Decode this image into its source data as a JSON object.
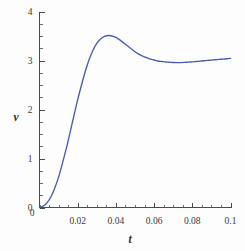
{
  "chart_data": {
    "type": "line",
    "title": "",
    "subtitle": "",
    "xlabel": "t",
    "ylabel": "v",
    "xlim": [
      0,
      0.1
    ],
    "ylim": [
      0,
      4
    ],
    "grid": false,
    "legend": null,
    "x_ticks": [
      0.02,
      0.04,
      0.06,
      0.08,
      0.1
    ],
    "x_tick_labels": [
      "0.02",
      "0.04",
      "0.06",
      "0.08",
      "0.1"
    ],
    "x_minor_step": 0.005,
    "y_ticks": [
      0,
      1,
      2,
      3,
      4
    ],
    "y_tick_labels": [
      "0",
      "1",
      "2",
      "3",
      "4"
    ],
    "y_minor_step": 0.25,
    "origin_label": "0",
    "series": [
      {
        "name": "v(t)",
        "color": "#4a5bb0",
        "x": [
          0.0,
          0.002,
          0.004,
          0.006,
          0.008,
          0.01,
          0.012,
          0.014,
          0.016,
          0.018,
          0.02,
          0.022,
          0.024,
          0.026,
          0.028,
          0.03,
          0.032,
          0.034,
          0.036,
          0.038,
          0.04,
          0.042,
          0.044,
          0.046,
          0.048,
          0.05,
          0.052,
          0.054,
          0.056,
          0.058,
          0.06,
          0.062,
          0.064,
          0.066,
          0.068,
          0.07,
          0.072,
          0.074,
          0.076,
          0.078,
          0.08,
          0.082,
          0.084,
          0.086,
          0.088,
          0.09,
          0.092,
          0.094,
          0.096,
          0.098,
          0.1
        ],
        "y": [
          0.0,
          0.03,
          0.1,
          0.22,
          0.4,
          0.62,
          0.9,
          1.2,
          1.53,
          1.87,
          2.2,
          2.5,
          2.78,
          3.02,
          3.21,
          3.35,
          3.44,
          3.49,
          3.51,
          3.5,
          3.47,
          3.42,
          3.36,
          3.3,
          3.24,
          3.18,
          3.13,
          3.09,
          3.06,
          3.03,
          3.01,
          2.99,
          2.98,
          2.97,
          2.965,
          2.96,
          2.958,
          2.958,
          2.962,
          2.967,
          2.973,
          2.98,
          2.987,
          2.994,
          3.001,
          3.008,
          3.015,
          3.022,
          3.029,
          3.036,
          3.042
        ]
      }
    ],
    "annotations": {
      "peak": {
        "x": 0.036,
        "y": 3.51
      },
      "trough": {
        "x": 0.073,
        "y": 2.96
      },
      "end": {
        "x": 0.1,
        "y": 3.04
      }
    }
  }
}
